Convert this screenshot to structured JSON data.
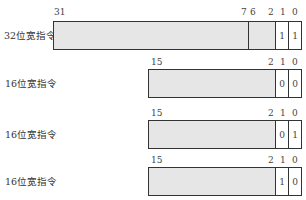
{
  "rows": [
    {
      "name": "32位宽指令",
      "bits": {
        "b31": "31",
        "b7": "7",
        "b6": "6",
        "b2": "2",
        "b1": "1",
        "b0": "0"
      },
      "values": {
        "bit1": "1",
        "bit0": "1"
      }
    },
    {
      "name": "16位宽指令",
      "bits": {
        "b15": "15",
        "b2": "2",
        "b1": "1",
        "b0": "0"
      },
      "values": {
        "bit1": "0",
        "bit0": "0"
      }
    },
    {
      "name": "16位宽指令",
      "bits": {
        "b15": "15",
        "b2": "2",
        "b1": "1",
        "b0": "0"
      },
      "values": {
        "bit1": "0",
        "bit0": "1"
      }
    },
    {
      "name": "16位宽指令",
      "bits": {
        "b15": "15",
        "b2": "2",
        "b1": "1",
        "b0": "0"
      },
      "values": {
        "bit1": "1",
        "bit0": "0"
      }
    }
  ]
}
